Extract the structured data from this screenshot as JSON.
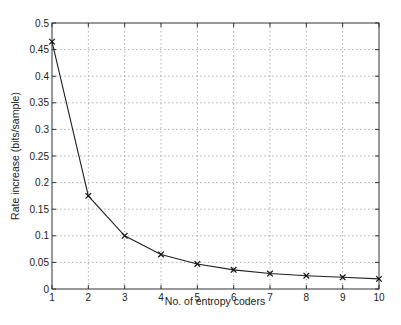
{
  "chart_data": {
    "type": "line",
    "title": "",
    "xlabel": "No. of entropy coders",
    "ylabel": "Rate increase (bits/sample)",
    "x": [
      1,
      2,
      3,
      4,
      5,
      6,
      7,
      8,
      9,
      10
    ],
    "series": [
      {
        "name": "Rate increase",
        "marker": "x",
        "color": "#222222",
        "values": [
          0.465,
          0.175,
          0.1,
          0.065,
          0.047,
          0.036,
          0.029,
          0.025,
          0.022,
          0.019
        ]
      }
    ],
    "xlim": [
      1,
      10
    ],
    "ylim": [
      0,
      0.5
    ],
    "xticks": [
      "1",
      "2",
      "3",
      "4",
      "5",
      "6",
      "7",
      "8",
      "9",
      "10"
    ],
    "yticks": [
      "0",
      "0.05",
      "0.1",
      "0.15",
      "0.2",
      "0.25",
      "0.3",
      "0.35",
      "0.4",
      "0.45",
      "0.5"
    ],
    "grid": true,
    "legend": null
  }
}
